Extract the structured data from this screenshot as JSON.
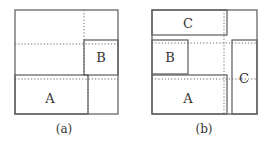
{
  "panels": [
    {
      "id": "a",
      "caption": "(a)",
      "outer": {
        "x": 15,
        "y": 10,
        "w": 103,
        "h": 104
      },
      "boxes": [
        {
          "label": "B",
          "x": 84,
          "y": 40,
          "w": 34,
          "h": 35
        },
        {
          "label": "A",
          "x": 15,
          "y": 75,
          "w": 73,
          "h": 39
        }
      ],
      "dotted_lines": [
        {
          "x1": 84,
          "y1": 10,
          "x2": 84,
          "y2": 76
        },
        {
          "x1": 88,
          "y1": 76,
          "x2": 88,
          "y2": 114
        },
        {
          "x1": 15,
          "y1": 44,
          "x2": 118,
          "y2": 44
        },
        {
          "x1": 15,
          "y1": 79,
          "x2": 118,
          "y2": 79
        }
      ]
    },
    {
      "id": "b",
      "caption": "(b)",
      "outer": {
        "x": 152,
        "y": 10,
        "w": 105,
        "h": 104
      },
      "boxes": [
        {
          "label": "C",
          "x": 152,
          "y": 10,
          "w": 75,
          "h": 25
        },
        {
          "label": "B",
          "x": 152,
          "y": 40,
          "w": 36,
          "h": 34
        },
        {
          "label": "A",
          "x": 152,
          "y": 75,
          "w": 75,
          "h": 39
        },
        {
          "label": "C",
          "x": 232,
          "y": 40,
          "w": 25,
          "h": 74
        }
      ],
      "dotted_lines": [
        {
          "x1": 224,
          "y1": 10,
          "x2": 224,
          "y2": 114
        },
        {
          "x1": 152,
          "y1": 43,
          "x2": 257,
          "y2": 43
        },
        {
          "x1": 152,
          "y1": 79,
          "x2": 257,
          "y2": 79
        }
      ]
    }
  ],
  "labels": {
    "a_B": "B",
    "a_A": "A",
    "a_caption": "(a)",
    "b_C_top": "C",
    "b_B": "B",
    "b_A": "A",
    "b_C_right": "C",
    "b_caption": "(b)"
  }
}
